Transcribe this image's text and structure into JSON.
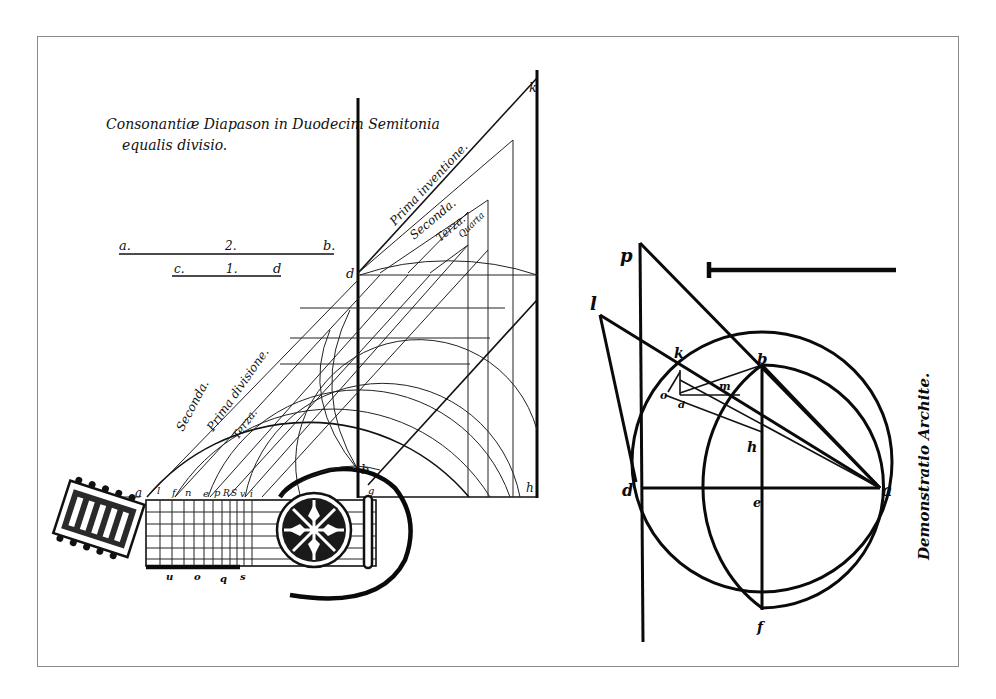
{
  "figure": {
    "title_line1": "Consonantiæ Diapason in Duodecim Semitonia",
    "title_line2": "equalis divisio."
  },
  "left_diagram": {
    "segment_ab": {
      "start": "a.",
      "mid": "2.",
      "end": "b."
    },
    "segment_cd": {
      "start": "c.",
      "mid": "1.",
      "end": "d"
    },
    "point_labels": {
      "d": "d",
      "k": "k",
      "b": "b",
      "g": "g",
      "h": "h"
    },
    "diagonal_labels": [
      "Prima inventione.",
      "Seconda.",
      "Terza.",
      "Quarta"
    ],
    "arc_labels": [
      "Seconda.",
      "Prima divisione.",
      "Terza."
    ],
    "fret_labels_top": [
      "a",
      "l",
      "f",
      "n",
      "e",
      "p",
      "R",
      "S",
      "v",
      "i"
    ],
    "fret_labels_bottom": [
      "u",
      "o",
      "q",
      "s"
    ]
  },
  "right_diagram": {
    "point_labels": {
      "p": "p",
      "l": "l",
      "k": "k",
      "o": "o",
      "d_small": "d",
      "m": "m",
      "b": "b",
      "h": "h",
      "d": "d",
      "e": "e",
      "a": "a",
      "f": "f"
    },
    "caption": "Demonstratio Archite."
  }
}
